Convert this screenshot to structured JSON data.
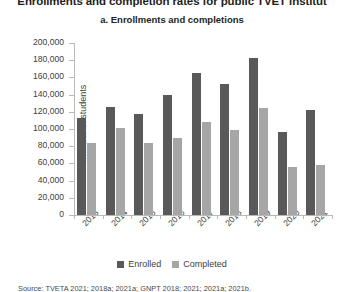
{
  "figure": {
    "main_title": "Enrollments and completion rates for public TVET institut",
    "sub_title": "a. Enrollments and completions",
    "source_text": "Source: TVETA 2021; 2018a; 2021a; GNPT 2018; 2021; 2021a; 2021b.",
    "colors": {
      "enrolled": "#595959",
      "completed": "#a6a6a6",
      "axis": "#b9b9b9",
      "text": "#404040",
      "title": "#231f20",
      "background": "#ffffff"
    }
  },
  "legend": {
    "position": "bottom-center",
    "items": [
      {
        "label": "Enrolled",
        "color": "#595959"
      },
      {
        "label": "Completed",
        "color": "#a6a6a6"
      }
    ]
  },
  "chart_data": {
    "type": "bar",
    "title": "a. Enrollments and completions",
    "xlabel": "",
    "ylabel": "Number of students",
    "ylim": [
      0,
      200000
    ],
    "ytick_step": 20000,
    "ytick_labels": [
      "0",
      "20,000",
      "40,000",
      "60,000",
      "80,000",
      "100,000",
      "120,000",
      "140,000",
      "160,000",
      "180,000",
      "200,000"
    ],
    "ytick_values": [
      0,
      20000,
      40000,
      60000,
      80000,
      100000,
      120000,
      140000,
      160000,
      180000,
      200000
    ],
    "grid": false,
    "categories": [
      "2013",
      "2014",
      "2015",
      "2016",
      "2017",
      "2018",
      "2019",
      "2020",
      "2021"
    ],
    "series": [
      {
        "name": "Enrolled",
        "color": "#595959",
        "values": [
          113000,
          126000,
          117000,
          140000,
          165000,
          152000,
          182000,
          97000,
          122000
        ]
      },
      {
        "name": "Completed",
        "color": "#a6a6a6",
        "values": [
          84000,
          101000,
          84000,
          90000,
          108000,
          99000,
          124000,
          56000,
          58000
        ]
      }
    ]
  }
}
